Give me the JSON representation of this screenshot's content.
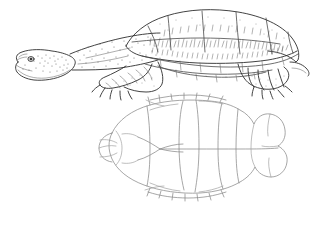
{
  "figure": {
    "background_color": "#ffffff",
    "width": 314,
    "height": 230,
    "style": "pen-and-ink scientific line drawing with stipple shading",
    "ink_color": "#4a4a4a",
    "shell_line_color": "#8a8a8a"
  },
  "panels": [
    {
      "id": "lateral-view",
      "label": "Turtle lateral view",
      "description": "Side view of a turtle facing left with extended neck, domed carapace, front and hind limbs with claws",
      "parts": [
        {
          "name": "head",
          "label": "Head"
        },
        {
          "name": "eye",
          "label": "Eye"
        },
        {
          "name": "neck",
          "label": "Neck"
        },
        {
          "name": "carapace",
          "label": "Carapace"
        },
        {
          "name": "marginal-scutes",
          "label": "Marginal scutes"
        },
        {
          "name": "vertebral-scutes",
          "label": "Vertebral scutes"
        },
        {
          "name": "costal-scutes",
          "label": "Costal scutes"
        },
        {
          "name": "forelimb",
          "label": "Forelimb"
        },
        {
          "name": "hindlimb",
          "label": "Hindlimb"
        },
        {
          "name": "claws",
          "label": "Claws"
        },
        {
          "name": "tail",
          "label": "Tail"
        }
      ]
    },
    {
      "id": "shell-outline",
      "label": "Shell outline diagram",
      "description": "Dorsal/ventral outline of the shell showing scute seams, midline, and marginal serrations",
      "parts": [
        {
          "name": "shell-outline",
          "label": "Shell outline"
        },
        {
          "name": "midline-seam",
          "label": "Midline seam"
        },
        {
          "name": "transverse-seam",
          "label": "Transverse seam"
        },
        {
          "name": "anterior-scutes",
          "label": "Anterior scutes"
        },
        {
          "name": "posterior-scutes",
          "label": "Posterior scutes"
        },
        {
          "name": "marginal-serrations",
          "label": "Marginal serrations"
        }
      ]
    }
  ]
}
